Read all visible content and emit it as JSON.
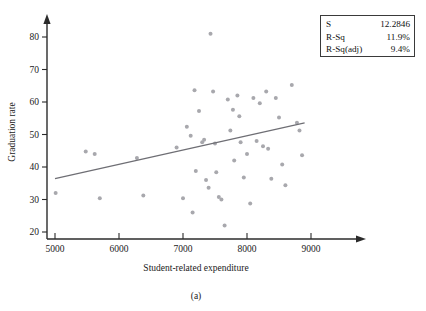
{
  "legend": {
    "rows": [
      {
        "label": "S",
        "value": "12.2846"
      },
      {
        "label": "R-Sq",
        "value": "11.9%"
      },
      {
        "label": "R-Sq(adj)",
        "value": "9.4%"
      }
    ]
  },
  "caption": "(a)",
  "chart_data": {
    "type": "scatter",
    "title": "",
    "xlabel": "Student-related expenditure",
    "ylabel": "Graduation rate",
    "xlim": [
      4700,
      9250
    ],
    "ylim": [
      16,
      84
    ],
    "xticks": [
      5000,
      6000,
      7000,
      8000,
      9000
    ],
    "yticks": [
      20,
      30,
      40,
      50,
      60,
      70,
      80
    ],
    "xticklabels": [
      "5000",
      "6000",
      "7000",
      "8000",
      "9000"
    ],
    "yticklabels": [
      "20",
      "30",
      "40",
      "50",
      "60",
      "70",
      "80"
    ],
    "grid": false,
    "legend_position": "top-right",
    "axis_arrows": true,
    "marker": {
      "shape": "circle",
      "size": 2.0,
      "color": "#a8a8ad"
    },
    "points": [
      {
        "x": 5010,
        "y": 32.0
      },
      {
        "x": 5480,
        "y": 44.8
      },
      {
        "x": 5620,
        "y": 44.0
      },
      {
        "x": 5700,
        "y": 30.4
      },
      {
        "x": 6280,
        "y": 42.8
      },
      {
        "x": 6380,
        "y": 31.2
      },
      {
        "x": 6900,
        "y": 46.0
      },
      {
        "x": 7000,
        "y": 30.4
      },
      {
        "x": 7060,
        "y": 52.4
      },
      {
        "x": 7120,
        "y": 49.6
      },
      {
        "x": 7150,
        "y": 26.0
      },
      {
        "x": 7180,
        "y": 63.6
      },
      {
        "x": 7200,
        "y": 38.8
      },
      {
        "x": 7250,
        "y": 57.2
      },
      {
        "x": 7300,
        "y": 47.6
      },
      {
        "x": 7330,
        "y": 48.4
      },
      {
        "x": 7360,
        "y": 36.0
      },
      {
        "x": 7400,
        "y": 33.6
      },
      {
        "x": 7430,
        "y": 81.0
      },
      {
        "x": 7470,
        "y": 63.2
      },
      {
        "x": 7500,
        "y": 47.2
      },
      {
        "x": 7520,
        "y": 38.4
      },
      {
        "x": 7560,
        "y": 30.8
      },
      {
        "x": 7600,
        "y": 30.0
      },
      {
        "x": 7650,
        "y": 22.0
      },
      {
        "x": 7700,
        "y": 60.8
      },
      {
        "x": 7740,
        "y": 51.2
      },
      {
        "x": 7780,
        "y": 57.6
      },
      {
        "x": 7800,
        "y": 42.0
      },
      {
        "x": 7850,
        "y": 62.0
      },
      {
        "x": 7880,
        "y": 55.6
      },
      {
        "x": 7900,
        "y": 47.6
      },
      {
        "x": 7950,
        "y": 36.8
      },
      {
        "x": 8000,
        "y": 44.0
      },
      {
        "x": 8050,
        "y": 28.8
      },
      {
        "x": 8100,
        "y": 61.2
      },
      {
        "x": 8150,
        "y": 48.0
      },
      {
        "x": 8200,
        "y": 59.6
      },
      {
        "x": 8250,
        "y": 46.4
      },
      {
        "x": 8300,
        "y": 63.2
      },
      {
        "x": 8330,
        "y": 45.6
      },
      {
        "x": 8380,
        "y": 36.4
      },
      {
        "x": 8450,
        "y": 61.2
      },
      {
        "x": 8500,
        "y": 55.2
      },
      {
        "x": 8550,
        "y": 40.8
      },
      {
        "x": 8600,
        "y": 34.4
      },
      {
        "x": 8700,
        "y": 65.2
      },
      {
        "x": 8780,
        "y": 53.6
      },
      {
        "x": 8820,
        "y": 51.2
      },
      {
        "x": 8860,
        "y": 43.6
      }
    ],
    "fit_line": {
      "x_start": 5000,
      "y_start": 36.4,
      "x_end": 8900,
      "y_end": 53.6,
      "color": "#6e6e74"
    }
  }
}
